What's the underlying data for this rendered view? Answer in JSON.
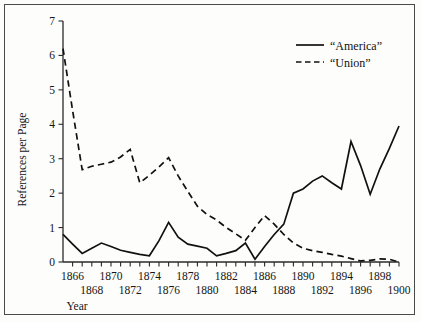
{
  "chart_data": {
    "type": "line",
    "title": "",
    "xlabel": "Year",
    "ylabel": "References per Page",
    "xlim": [
      1865,
      1900
    ],
    "ylim": [
      0,
      7
    ],
    "grid": false,
    "legend_position": "top-right",
    "x": [
      1865,
      1866,
      1867,
      1868,
      1869,
      1870,
      1871,
      1872,
      1873,
      1874,
      1875,
      1876,
      1877,
      1878,
      1879,
      1880,
      1881,
      1882,
      1883,
      1884,
      1885,
      1886,
      1887,
      1888,
      1889,
      1890,
      1891,
      1892,
      1893,
      1894,
      1895,
      1896,
      1897,
      1898,
      1899,
      1900
    ],
    "xtick_labels_upper": [
      "1866",
      "1870",
      "1874",
      "1878",
      "1882",
      "1886",
      "1890",
      "1894",
      "1898"
    ],
    "xtick_values_upper": [
      1866,
      1870,
      1874,
      1878,
      1882,
      1886,
      1890,
      1894,
      1898
    ],
    "xtick_labels_lower": [
      "1868",
      "1872",
      "1876",
      "1880",
      "1884",
      "1888",
      "1892",
      "1896",
      "1900"
    ],
    "xtick_values_lower": [
      1868,
      1872,
      1876,
      1880,
      1884,
      1888,
      1892,
      1896,
      1900
    ],
    "ytick_labels": [
      "0",
      "1",
      "2",
      "3",
      "4",
      "5",
      "6",
      "7"
    ],
    "ytick_values": [
      0,
      1,
      2,
      3,
      4,
      5,
      6,
      7
    ],
    "series": [
      {
        "name": "“America”",
        "style": "solid",
        "color": "#111111",
        "values": [
          0.8,
          0.52,
          0.25,
          0.4,
          0.55,
          0.45,
          0.34,
          0.28,
          0.22,
          0.18,
          0.62,
          1.15,
          0.72,
          0.52,
          0.46,
          0.4,
          0.18,
          0.25,
          0.33,
          0.55,
          0.08,
          0.45,
          0.8,
          1.1,
          2.0,
          2.12,
          2.35,
          2.5,
          2.3,
          2.12,
          3.5,
          2.8,
          1.97,
          2.7,
          3.3,
          3.95
        ]
      },
      {
        "name": "“Union”",
        "style": "dashed",
        "color": "#111111",
        "values": [
          6.2,
          4.4,
          2.68,
          2.78,
          2.84,
          2.9,
          3.05,
          3.27,
          2.3,
          2.52,
          2.76,
          3.03,
          2.5,
          2.05,
          1.62,
          1.38,
          1.22,
          1.0,
          0.82,
          0.63,
          1.0,
          1.35,
          1.1,
          0.8,
          0.55,
          0.4,
          0.33,
          0.28,
          0.22,
          0.17,
          0.1,
          0.03,
          0.05,
          0.09,
          0.08,
          0.0
        ]
      }
    ]
  },
  "legend": {
    "entries": [
      {
        "label": "“America”",
        "style": "solid"
      },
      {
        "label": "“Union”",
        "style": "dashed"
      }
    ]
  },
  "axes": {
    "y_title": "References per Page",
    "x_title": "Year"
  }
}
